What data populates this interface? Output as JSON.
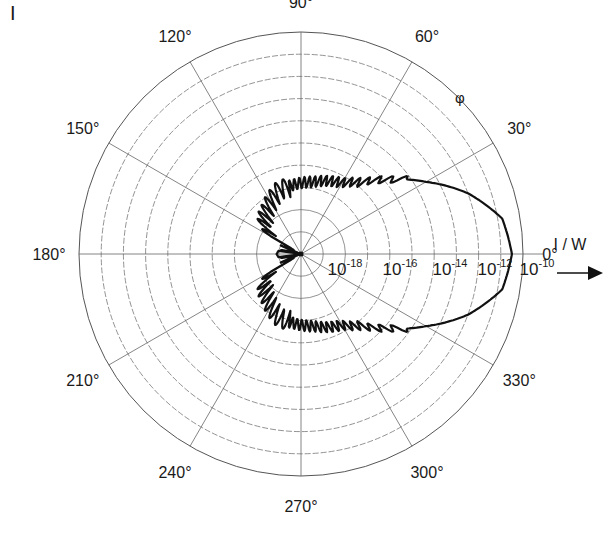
{
  "panel_label": "I",
  "chart_data": {
    "type": "polar",
    "title": "",
    "angular_axis": {
      "symbol": "φ",
      "ticks": [
        "0°",
        "30°",
        "60°",
        "90°",
        "120°",
        "150°",
        "180°",
        "210°",
        "240°",
        "270°",
        "300°",
        "330°"
      ],
      "tick_angles": [
        0,
        30,
        60,
        90,
        120,
        150,
        180,
        210,
        240,
        270,
        300,
        330
      ]
    },
    "radial_axis": {
      "label": "I / W",
      "scale": "log",
      "tick_labels": [
        {
          "base": "10",
          "exp": "-18"
        },
        {
          "base": "10",
          "exp": "-16"
        },
        {
          "base": "10",
          "exp": "-14"
        },
        {
          "base": "10",
          "exp": "-12"
        },
        {
          "base": "10",
          "exp": "-10"
        }
      ],
      "range": [
        "1e-20",
        "1e-10"
      ],
      "rings": 10,
      "grid": true
    },
    "series": [
      {
        "name": "radiated intensity",
        "description": "Main forward lobe along 0° reaching ~1e-10.5 W; oscillating side-lobes between ~60° and ~150° near 1e-16..1e-17 W; small backward lobe at 180° near 1e-19 W; symmetric about 0°",
        "points_deg_log10W": [
          [
            0,
            -10.5
          ],
          [
            10,
            -10.8
          ],
          [
            20,
            -12.0
          ],
          [
            30,
            -13.5
          ],
          [
            40,
            -14.8
          ],
          [
            50,
            -15.8
          ],
          [
            60,
            -16.3
          ],
          [
            70,
            -16.5
          ],
          [
            80,
            -16.7
          ],
          [
            90,
            -16.8
          ],
          [
            100,
            -16.9
          ],
          [
            110,
            -17.0
          ],
          [
            120,
            -17.3
          ],
          [
            130,
            -17.6
          ],
          [
            140,
            -17.8
          ],
          [
            150,
            -18.5
          ],
          [
            160,
            -19.2
          ],
          [
            170,
            -19.0
          ],
          [
            180,
            -18.9
          ]
        ]
      }
    ]
  }
}
